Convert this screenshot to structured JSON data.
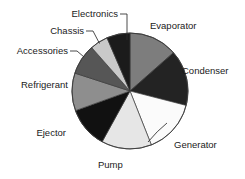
{
  "chart_data": {
    "type": "pie",
    "title": "",
    "subtitle": "",
    "xlabel": "",
    "ylabel": "",
    "grid": false,
    "legend_position": "none",
    "label_placement": "outside-with-leader-lines",
    "start_angle_deg": -90,
    "direction": "clockwise",
    "categories": [
      "Evaporator",
      "Condenser",
      "Generator",
      "Pump",
      "Ejector",
      "Refrigerant",
      "Accessories",
      "Chassis",
      "Electronics"
    ],
    "values": [
      13.5,
      15.5,
      15.0,
      14.0,
      11.5,
      10.5,
      8.5,
      5.0,
      6.5
    ],
    "unit": "percent",
    "colors": [
      "#7d7d7d",
      "#232323",
      "#fbfbfb",
      "#e6e6e6",
      "#111111",
      "#8e8e8e",
      "#565656",
      "#c9c9c9",
      "#1b1b1b"
    ],
    "slices": [
      {
        "label": "Evaporator",
        "value": 13.5,
        "color": "#7d7d7d",
        "leader_line": false
      },
      {
        "label": "Condenser",
        "value": 15.5,
        "color": "#232323",
        "leader_line": false
      },
      {
        "label": "Generator",
        "value": 15.0,
        "color": "#fbfbfb",
        "leader_line": true
      },
      {
        "label": "Pump",
        "value": 14.0,
        "color": "#e6e6e6",
        "leader_line": false
      },
      {
        "label": "Ejector",
        "value": 11.5,
        "color": "#111111",
        "leader_line": false
      },
      {
        "label": "Refrigerant",
        "value": 10.5,
        "color": "#8e8e8e",
        "leader_line": false
      },
      {
        "label": "Accessories",
        "value": 8.5,
        "color": "#565656",
        "leader_line": true
      },
      {
        "label": "Chassis",
        "value": 5.0,
        "color": "#c9c9c9",
        "leader_line": true
      },
      {
        "label": "Electronics",
        "value": 6.5,
        "color": "#1b1b1b",
        "leader_line": true
      }
    ]
  },
  "labels": {
    "evaporator": "Evaporator",
    "condenser": "Condenser",
    "generator": "Generator",
    "pump": "Pump",
    "ejector": "Ejector",
    "refrigerant": "Refrigerant",
    "accessories": "Accessories",
    "chassis": "Chassis",
    "electronics": "Electronics"
  },
  "style": {
    "background": "#ffffff",
    "text_color": "#1a1a1a",
    "outline_color": "#3a3a3a",
    "leader_color": "#2b2b2b"
  }
}
